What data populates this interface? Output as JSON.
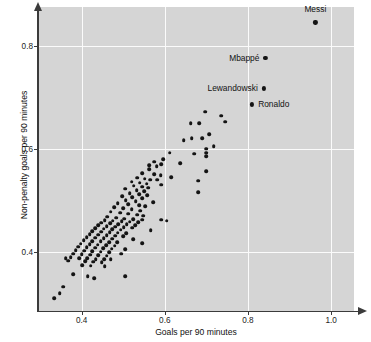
{
  "chart": {
    "type": "scatter",
    "title": "",
    "xlabel": "Goals per 90 minutes",
    "ylabel": "Non-penalty goals per 90 minutes",
    "xlim": [
      0.295,
      1.055
    ],
    "ylim": [
      0.285,
      0.875
    ],
    "xticks": [
      0.4,
      0.6,
      0.8,
      1.0
    ],
    "xticklabels": [
      "0.4",
      "0.6",
      "0.8",
      "1.0"
    ],
    "yticks": [
      0.4,
      0.6,
      0.8
    ],
    "yticklabels": [
      "0.4",
      "0.6",
      "0.8"
    ],
    "grid": true,
    "grid_color": "#fbfbfb",
    "panel_color": "#d5d5d5",
    "marker_color": "#141414",
    "axis_color": "#3b3b3b",
    "legend": "none"
  },
  "chart_data": {
    "type": "scatter",
    "title": "",
    "xlabel": "Goals per 90 minutes",
    "ylabel": "Non-penalty goals per 90 minutes",
    "xlim": [
      0.295,
      1.055
    ],
    "ylim": [
      0.285,
      0.875
    ],
    "xticks": [
      0.4,
      0.6,
      0.8,
      1.0
    ],
    "yticks": [
      0.4,
      0.6,
      0.8
    ],
    "grid": true,
    "legend_position": "none",
    "annotations": [
      {
        "label": "Messi",
        "x": 0.962,
        "y": 0.845,
        "label_side": "above"
      },
      {
        "label": "Mbappé",
        "x": 0.842,
        "y": 0.776,
        "label_side": "left"
      },
      {
        "label": "Lewandowski",
        "x": 0.838,
        "y": 0.717,
        "label_side": "left"
      },
      {
        "label": "Ronaldo",
        "x": 0.81,
        "y": 0.686,
        "label_side": "right"
      }
    ],
    "series": [
      {
        "name": "Forwards",
        "points": [
          [
            0.962,
            0.845
          ],
          [
            0.842,
            0.776
          ],
          [
            0.838,
            0.717
          ],
          [
            0.81,
            0.686
          ],
          [
            0.697,
            0.672
          ],
          [
            0.735,
            0.664
          ],
          [
            0.745,
            0.652
          ],
          [
            0.662,
            0.65
          ],
          [
            0.683,
            0.65
          ],
          [
            0.707,
            0.628
          ],
          [
            0.665,
            0.62
          ],
          [
            0.69,
            0.62
          ],
          [
            0.645,
            0.617
          ],
          [
            0.718,
            0.605
          ],
          [
            0.7,
            0.6
          ],
          [
            0.7,
            0.592
          ],
          [
            0.612,
            0.592
          ],
          [
            0.67,
            0.59
          ],
          [
            0.7,
            0.585
          ],
          [
            0.596,
            0.58
          ],
          [
            0.575,
            0.575
          ],
          [
            0.637,
            0.572
          ],
          [
            0.592,
            0.57
          ],
          [
            0.563,
            0.568
          ],
          [
            0.58,
            0.566
          ],
          [
            0.562,
            0.56
          ],
          [
            0.7,
            0.556
          ],
          [
            0.545,
            0.552
          ],
          [
            0.575,
            0.55
          ],
          [
            0.59,
            0.548
          ],
          [
            0.615,
            0.545
          ],
          [
            0.533,
            0.544
          ],
          [
            0.552,
            0.542
          ],
          [
            0.565,
            0.54
          ],
          [
            0.582,
            0.54
          ],
          [
            0.68,
            0.538
          ],
          [
            0.52,
            0.536
          ],
          [
            0.54,
            0.534
          ],
          [
            0.556,
            0.532
          ],
          [
            0.592,
            0.53
          ],
          [
            0.525,
            0.528
          ],
          [
            0.545,
            0.526
          ],
          [
            0.56,
            0.524
          ],
          [
            0.505,
            0.522
          ],
          [
            0.532,
            0.52
          ],
          [
            0.55,
            0.518
          ],
          [
            0.68,
            0.516
          ],
          [
            0.516,
            0.514
          ],
          [
            0.538,
            0.512
          ],
          [
            0.558,
            0.51
          ],
          [
            0.497,
            0.508
          ],
          [
            0.522,
            0.506
          ],
          [
            0.545,
            0.504
          ],
          [
            0.506,
            0.5
          ],
          [
            0.53,
            0.498
          ],
          [
            0.572,
            0.496
          ],
          [
            0.487,
            0.494
          ],
          [
            0.512,
            0.492
          ],
          [
            0.538,
            0.49
          ],
          [
            0.553,
            0.488
          ],
          [
            0.478,
            0.486
          ],
          [
            0.5,
            0.484
          ],
          [
            0.52,
            0.482
          ],
          [
            0.541,
            0.48
          ],
          [
            0.47,
            0.478
          ],
          [
            0.492,
            0.476
          ],
          [
            0.512,
            0.474
          ],
          [
            0.533,
            0.472
          ],
          [
            0.548,
            0.47
          ],
          [
            0.462,
            0.468
          ],
          [
            0.483,
            0.466
          ],
          [
            0.503,
            0.464
          ],
          [
            0.524,
            0.463
          ],
          [
            0.545,
            0.462
          ],
          [
            0.455,
            0.461
          ],
          [
            0.475,
            0.46
          ],
          [
            0.496,
            0.459
          ],
          [
            0.516,
            0.458
          ],
          [
            0.536,
            0.457
          ],
          [
            0.447,
            0.456
          ],
          [
            0.468,
            0.455
          ],
          [
            0.488,
            0.454
          ],
          [
            0.508,
            0.453
          ],
          [
            0.529,
            0.452
          ],
          [
            0.44,
            0.451
          ],
          [
            0.46,
            0.45
          ],
          [
            0.481,
            0.449
          ],
          [
            0.501,
            0.448
          ],
          [
            0.521,
            0.447
          ],
          [
            0.433,
            0.446
          ],
          [
            0.453,
            0.445
          ],
          [
            0.474,
            0.444
          ],
          [
            0.494,
            0.443
          ],
          [
            0.592,
            0.462
          ],
          [
            0.605,
            0.46
          ],
          [
            0.566,
            0.442
          ],
          [
            0.426,
            0.44
          ],
          [
            0.447,
            0.439
          ],
          [
            0.467,
            0.438
          ],
          [
            0.487,
            0.437
          ],
          [
            0.507,
            0.436
          ],
          [
            0.419,
            0.434
          ],
          [
            0.44,
            0.433
          ],
          [
            0.46,
            0.432
          ],
          [
            0.48,
            0.431
          ],
          [
            0.5,
            0.43
          ],
          [
            0.412,
            0.428
          ],
          [
            0.433,
            0.427
          ],
          [
            0.453,
            0.426
          ],
          [
            0.473,
            0.425
          ],
          [
            0.524,
            0.424
          ],
          [
            0.405,
            0.422
          ],
          [
            0.426,
            0.421
          ],
          [
            0.446,
            0.42
          ],
          [
            0.466,
            0.419
          ],
          [
            0.486,
            0.418
          ],
          [
            0.546,
            0.417
          ],
          [
            0.398,
            0.416
          ],
          [
            0.419,
            0.415
          ],
          [
            0.439,
            0.414
          ],
          [
            0.459,
            0.413
          ],
          [
            0.479,
            0.412
          ],
          [
            0.392,
            0.41
          ],
          [
            0.412,
            0.409
          ],
          [
            0.432,
            0.408
          ],
          [
            0.452,
            0.407
          ],
          [
            0.472,
            0.406
          ],
          [
            0.505,
            0.405
          ],
          [
            0.386,
            0.403
          ],
          [
            0.406,
            0.402
          ],
          [
            0.426,
            0.401
          ],
          [
            0.446,
            0.4
          ],
          [
            0.466,
            0.399
          ],
          [
            0.38,
            0.396
          ],
          [
            0.4,
            0.395
          ],
          [
            0.42,
            0.394
          ],
          [
            0.44,
            0.393
          ],
          [
            0.46,
            0.392
          ],
          [
            0.374,
            0.389
          ],
          [
            0.394,
            0.388
          ],
          [
            0.414,
            0.387
          ],
          [
            0.434,
            0.386
          ],
          [
            0.454,
            0.385
          ],
          [
            0.368,
            0.383
          ],
          [
            0.408,
            0.382
          ],
          [
            0.428,
            0.381
          ],
          [
            0.448,
            0.38
          ],
          [
            0.402,
            0.374
          ],
          [
            0.422,
            0.373
          ],
          [
            0.455,
            0.372
          ],
          [
            0.47,
            0.385
          ],
          [
            0.495,
            0.396
          ],
          [
            0.362,
            0.388
          ],
          [
            0.379,
            0.356
          ],
          [
            0.415,
            0.352
          ],
          [
            0.43,
            0.349
          ],
          [
            0.505,
            0.353
          ],
          [
            0.347,
            0.32
          ],
          [
            0.334,
            0.31
          ],
          [
            0.356,
            0.332
          ]
        ]
      }
    ]
  }
}
